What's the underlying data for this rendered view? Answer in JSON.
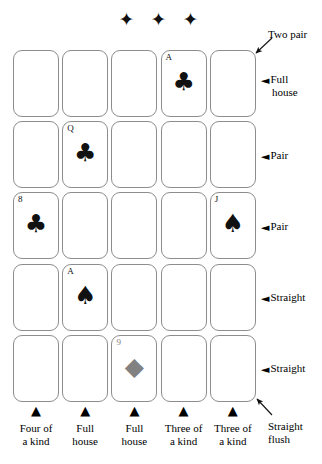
{
  "figure": {
    "ornament": "✦ ✦ ✦",
    "ornament_name": "three-diamond-ornament"
  },
  "grid": {
    "rows": 5,
    "columns": 5,
    "cards": [
      {
        "row": 1,
        "col": 1,
        "rank": "",
        "suit": "",
        "pip": "",
        "color": "black"
      },
      {
        "row": 1,
        "col": 2,
        "rank": "",
        "suit": "",
        "pip": "",
        "color": "black"
      },
      {
        "row": 1,
        "col": 3,
        "rank": "",
        "suit": "",
        "pip": "",
        "color": "black"
      },
      {
        "row": 1,
        "col": 4,
        "rank": "A",
        "suit": "clubs",
        "pip": "♣",
        "color": "black"
      },
      {
        "row": 1,
        "col": 5,
        "rank": "",
        "suit": "",
        "pip": "",
        "color": "black"
      },
      {
        "row": 2,
        "col": 1,
        "rank": "",
        "suit": "",
        "pip": "",
        "color": "black"
      },
      {
        "row": 2,
        "col": 2,
        "rank": "Q",
        "suit": "clubs",
        "pip": "♣",
        "color": "black"
      },
      {
        "row": 2,
        "col": 3,
        "rank": "",
        "suit": "",
        "pip": "",
        "color": "black"
      },
      {
        "row": 2,
        "col": 4,
        "rank": "",
        "suit": "",
        "pip": "",
        "color": "black"
      },
      {
        "row": 2,
        "col": 5,
        "rank": "",
        "suit": "",
        "pip": "",
        "color": "black"
      },
      {
        "row": 3,
        "col": 1,
        "rank": "8",
        "suit": "clubs",
        "pip": "♣",
        "color": "black"
      },
      {
        "row": 3,
        "col": 2,
        "rank": "",
        "suit": "",
        "pip": "",
        "color": "black"
      },
      {
        "row": 3,
        "col": 3,
        "rank": "",
        "suit": "",
        "pip": "",
        "color": "black"
      },
      {
        "row": 3,
        "col": 4,
        "rank": "",
        "suit": "",
        "pip": "",
        "color": "black"
      },
      {
        "row": 3,
        "col": 5,
        "rank": "J",
        "suit": "spades",
        "pip": "♠",
        "color": "black"
      },
      {
        "row": 4,
        "col": 1,
        "rank": "",
        "suit": "",
        "pip": "",
        "color": "black"
      },
      {
        "row": 4,
        "col": 2,
        "rank": "A",
        "suit": "spades",
        "pip": "♠",
        "color": "black"
      },
      {
        "row": 4,
        "col": 3,
        "rank": "",
        "suit": "",
        "pip": "",
        "color": "black"
      },
      {
        "row": 4,
        "col": 4,
        "rank": "",
        "suit": "",
        "pip": "",
        "color": "black"
      },
      {
        "row": 4,
        "col": 5,
        "rank": "",
        "suit": "",
        "pip": "",
        "color": "black"
      },
      {
        "row": 5,
        "col": 1,
        "rank": "",
        "suit": "",
        "pip": "",
        "color": "black"
      },
      {
        "row": 5,
        "col": 2,
        "rank": "",
        "suit": "",
        "pip": "",
        "color": "black"
      },
      {
        "row": 5,
        "col": 3,
        "rank": "9",
        "suit": "diamonds",
        "pip": "◆",
        "color": "gray"
      },
      {
        "row": 5,
        "col": 4,
        "rank": "",
        "suit": "",
        "pip": "",
        "color": "black"
      },
      {
        "row": 5,
        "col": 5,
        "rank": "",
        "suit": "",
        "pip": "",
        "color": "black"
      }
    ]
  },
  "row_labels": [
    {
      "id": "two-pair",
      "text": "Two pair",
      "arrow": "diagonal"
    },
    {
      "id": "full-house",
      "text_line1": "Full",
      "text_line2": "house",
      "arrow": "horizontal"
    },
    {
      "id": "pair-row2",
      "text": "Pair",
      "arrow": "horizontal"
    },
    {
      "id": "pair-row3",
      "text": "Pair",
      "arrow": "horizontal"
    },
    {
      "id": "straight-row4",
      "text": "Straight",
      "arrow": "horizontal"
    },
    {
      "id": "straight-row5",
      "text": "Straight",
      "arrow": "horizontal"
    },
    {
      "id": "straight-flush",
      "text_line1": "Straight",
      "text_line2": "flush",
      "arrow": "diagonal"
    }
  ],
  "column_labels": [
    {
      "id": "col1",
      "line1": "Four of",
      "line2": "a kind"
    },
    {
      "id": "col2",
      "line1": "Full",
      "line2": "house"
    },
    {
      "id": "col3",
      "line1": "Full",
      "line2": "house"
    },
    {
      "id": "col4",
      "line1": "Three of",
      "line2": "a kind"
    },
    {
      "id": "col5",
      "line1": "Three of",
      "line2": "a kind"
    }
  ],
  "arrow_glyphs": {
    "left": "◄",
    "up": "▲"
  },
  "colors": {
    "card_border": "#8d8d8d",
    "ink": "#111111",
    "gray_suit": "#818181",
    "background": "#ffffff"
  }
}
